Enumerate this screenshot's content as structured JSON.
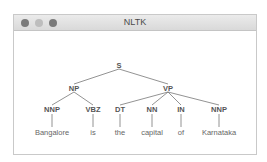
{
  "window": {
    "title": "NLTK",
    "traffic_lights": [
      {
        "name": "close",
        "color": "#7a7a7a"
      },
      {
        "name": "minimize",
        "color": "#bdbdbd"
      },
      {
        "name": "maximize",
        "color": "#7a7a7a"
      }
    ]
  },
  "tree": {
    "root": {
      "label": "S",
      "x": 105,
      "y": 34
    },
    "phrases": [
      {
        "label": "NP",
        "x": 60,
        "y": 57
      },
      {
        "label": "VP",
        "x": 154,
        "y": 57
      }
    ],
    "pos": [
      {
        "label": "NNP",
        "x": 38,
        "y": 78
      },
      {
        "label": "VBZ",
        "x": 79,
        "y": 78
      },
      {
        "label": "DT",
        "x": 106,
        "y": 78
      },
      {
        "label": "NN",
        "x": 138,
        "y": 78
      },
      {
        "label": "IN",
        "x": 167,
        "y": 78
      },
      {
        "label": "NNP",
        "x": 205,
        "y": 78
      }
    ],
    "words": [
      {
        "label": "Bangalore",
        "x": 38,
        "y": 101
      },
      {
        "label": "is",
        "x": 79,
        "y": 101
      },
      {
        "label": "the",
        "x": 106,
        "y": 101
      },
      {
        "label": "capital",
        "x": 138,
        "y": 101
      },
      {
        "label": "of",
        "x": 167,
        "y": 101
      },
      {
        "label": "Karnataka",
        "x": 205,
        "y": 101
      }
    ]
  }
}
